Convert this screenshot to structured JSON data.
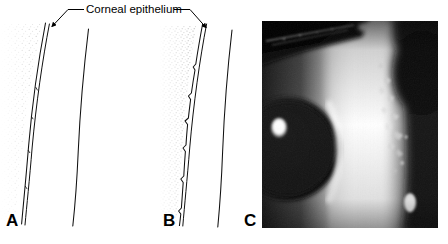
{
  "figure": {
    "kind": "medical-illustration-figure",
    "callout": {
      "label": "Corneal epithelium",
      "leader_left_arrow_target": "panel-a-epithelium",
      "leader_right_arrow_target": "panel-b-epithelium"
    },
    "panels": [
      {
        "id": "A",
        "label": "A",
        "type": "line-diagram",
        "description": "Cross-sectional diagram of cornea with smooth, regular epithelium",
        "features": [
          "stippled tear-film layer",
          "smooth anterior epithelial surface line",
          "basement membrane line",
          "posterior corneal curve"
        ]
      },
      {
        "id": "B",
        "label": "B",
        "type": "line-diagram",
        "description": "Cross-sectional diagram of cornea with irregular, jagged epithelium",
        "features": [
          "dense stippled tear-film layer",
          "irregular jagged anterior epithelial surface line",
          "basement membrane line",
          "posterior corneal curve"
        ]
      },
      {
        "id": "C",
        "label": "C",
        "type": "photograph",
        "description": "Slit-lamp photograph of cornea showing irregular epithelium with bright slit beam",
        "features": [
          "dark upper eyelid and lashes",
          "bright vertical slit-beam band",
          "dark pupil with white specular highlight",
          "irregular white epithelial speckles along beam edge"
        ]
      }
    ],
    "colors": {
      "background": "#ffffff",
      "ink": "#000000",
      "stipple": "#8d8d8d",
      "photo_shadow": "#0b0b0b",
      "photo_highlight": "#ffffff"
    }
  }
}
